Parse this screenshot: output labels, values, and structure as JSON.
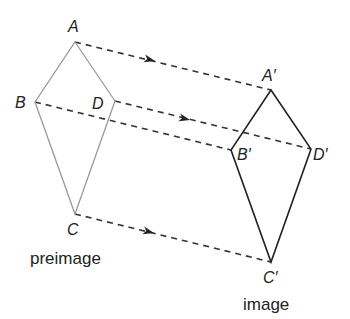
{
  "diagram": {
    "type": "translation",
    "preimage": {
      "caption": "preimage",
      "color": "#9a9a9a",
      "vertices": [
        {
          "name": "A",
          "label": "A",
          "x": 75,
          "y": 42
        },
        {
          "name": "B",
          "label": "B",
          "x": 35,
          "y": 102
        },
        {
          "name": "C",
          "label": "C",
          "x": 75,
          "y": 214
        },
        {
          "name": "D",
          "label": "D",
          "x": 115,
          "y": 101
        }
      ]
    },
    "image": {
      "caption": "image",
      "color": "#222222",
      "vertices": [
        {
          "name": "A'",
          "label": "A′",
          "x": 271,
          "y": 90
        },
        {
          "name": "B'",
          "label": "B′",
          "x": 231,
          "y": 150
        },
        {
          "name": "C'",
          "label": "C′",
          "x": 271,
          "y": 262
        },
        {
          "name": "D'",
          "label": "D′",
          "x": 311,
          "y": 149
        }
      ]
    },
    "translation_vector": {
      "dx": 196,
      "dy": 48
    },
    "mapping_lines": [
      {
        "from": "A",
        "to": "A'",
        "arrow": true
      },
      {
        "from": "B",
        "to": "B'",
        "arrow": false
      },
      {
        "from": "D",
        "to": "D'",
        "arrow": true
      },
      {
        "from": "C",
        "to": "C'",
        "arrow": true
      }
    ]
  },
  "labels": {
    "A": "A",
    "B": "B",
    "C": "C",
    "D": "D",
    "A_prime": "A′",
    "B_prime": "B′",
    "C_prime": "C′",
    "D_prime": "D′",
    "preimage_caption": "preimage",
    "image_caption": "image"
  }
}
